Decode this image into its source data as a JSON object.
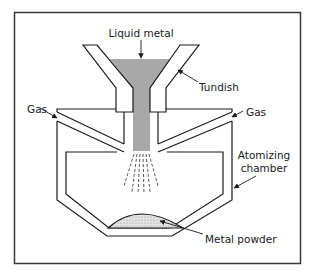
{
  "diagram": {
    "type": "gas atomization process schematic",
    "labels": {
      "liquid_metal": "Liquid metal",
      "tundish": "Tundish",
      "gas_left": "Gas",
      "gas_right": "Gas",
      "atomizing_chamber_line1": "Atomizing",
      "atomizing_chamber_line2": "chamber",
      "metal_powder": "Metal powder"
    },
    "colors": {
      "line": "#1a1a1a",
      "molten_metal": "#a8a8a8",
      "powder": "#d8d8d8",
      "background": "#ffffff"
    }
  }
}
